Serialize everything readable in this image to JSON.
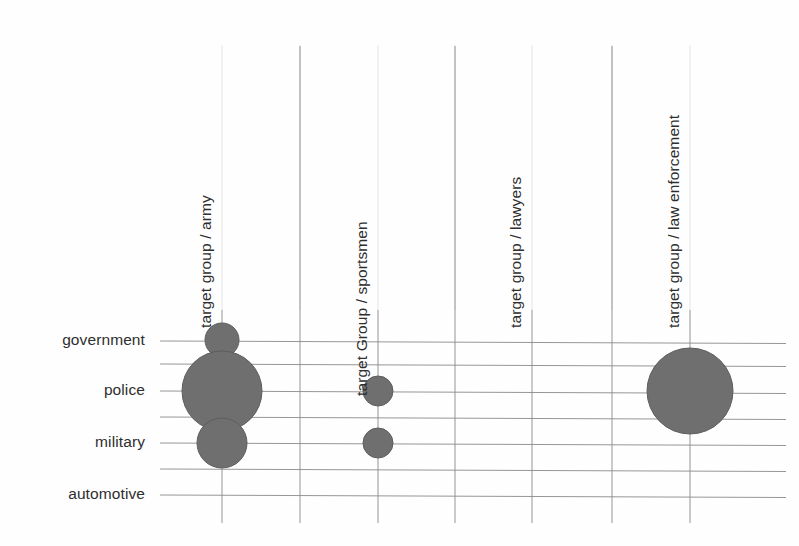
{
  "chart_data": {
    "type": "scatter",
    "subtype": "bubble-matrix",
    "title": "",
    "subtitle": "",
    "xlabel": "",
    "ylabel": "",
    "grid": true,
    "legend": "none",
    "background_color": "#fefefe",
    "bubble_color": "#6f6f6f",
    "bubble_stroke_color": "#5d5d5d",
    "gridline_color": "#8a8a8a",
    "faint_gridline_color": "#e4e4e4",
    "text_color": "#2e2e2e",
    "categories": [
      "government",
      "police",
      "military",
      "automotive"
    ],
    "columns": [
      "target group / army",
      "target Group / sportsmen",
      "target group / lawyers",
      "target group / law enforcement"
    ],
    "points": [
      {
        "column": "target group / army",
        "category": "government",
        "radius": 17,
        "value": 1
      },
      {
        "column": "target group / army",
        "category": "police",
        "radius": 40,
        "value": 5.5
      },
      {
        "column": "target group / army",
        "category": "military",
        "radius": 25,
        "value": 2.2
      },
      {
        "column": "target Group / sportsmen",
        "category": "police",
        "radius": 15,
        "value": 0.8
      },
      {
        "column": "target Group / sportsmen",
        "category": "military",
        "radius": 15,
        "value": 0.8
      },
      {
        "column": "target group / law enforcement",
        "category": "police",
        "radius": 43,
        "value": 6.3
      }
    ],
    "axis_rows": [
      {
        "label": "government",
        "y": 341
      },
      {
        "label": "",
        "y": 364
      },
      {
        "label": "police",
        "y": 391
      },
      {
        "label": "",
        "y": 417
      },
      {
        "label": "military",
        "y": 443
      },
      {
        "label": "",
        "y": 469
      },
      {
        "label": "automotive",
        "y": 495
      }
    ],
    "axis_columns": [
      {
        "label": "target group / army",
        "x": 222,
        "labeled": true
      },
      {
        "label": "",
        "x": 300,
        "labeled": false
      },
      {
        "label": "target Group / sportsmen",
        "x": 378,
        "labeled": true
      },
      {
        "label": "",
        "x": 455,
        "labeled": false
      },
      {
        "label": "target group / lawyers",
        "x": 532,
        "labeled": true
      },
      {
        "label": "",
        "x": 612,
        "labeled": false
      },
      {
        "label": "target group / law enforcement",
        "x": 690,
        "labeled": true
      }
    ],
    "bubbles_xy": [
      {
        "cx": 222,
        "cy": 340,
        "r": 17,
        "column": "target group / army",
        "category": "government"
      },
      {
        "cx": 222,
        "cy": 391,
        "r": 40,
        "column": "target group / army",
        "category": "police"
      },
      {
        "cx": 222,
        "cy": 443,
        "r": 25,
        "column": "target group / army",
        "category": "military"
      },
      {
        "cx": 378,
        "cy": 391,
        "r": 15,
        "column": "target Group / sportsmen",
        "category": "police"
      },
      {
        "cx": 378,
        "cy": 443,
        "r": 15,
        "column": "target Group / sportsmen",
        "category": "military"
      },
      {
        "cx": 690,
        "cy": 391,
        "r": 43,
        "column": "target group / law enforcement",
        "category": "police"
      }
    ]
  },
  "axis": {
    "row_labels": {
      "government": "government",
      "police": "police",
      "military": "military",
      "automotive": "automotive"
    },
    "column_labels": {
      "army": "target group / army",
      "sportsmen": "target Group / sportsmen",
      "lawyers": "target group / lawyers",
      "law_enforcement": "target group / law enforcement"
    }
  }
}
